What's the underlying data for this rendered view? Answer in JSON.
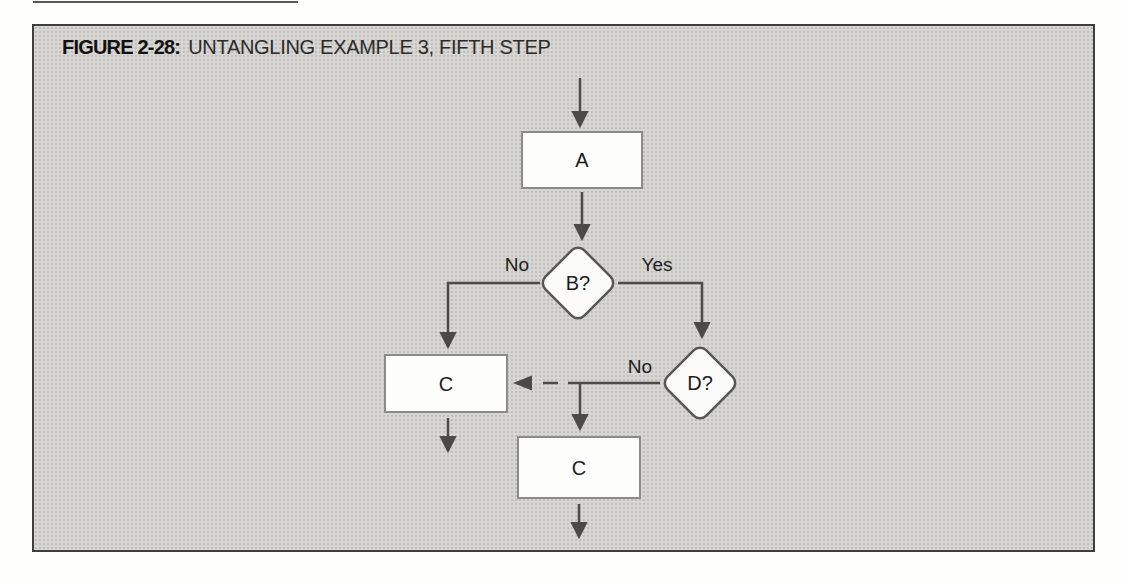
{
  "figure": {
    "label": "FIGURE 2-28:",
    "title": "UNTANGLING EXAMPLE 3, FIFTH STEP"
  },
  "flowchart": {
    "type": "flowchart",
    "nodes": [
      {
        "id": "A",
        "type": "process",
        "label": "A"
      },
      {
        "id": "B",
        "type": "decision",
        "label": "B?"
      },
      {
        "id": "C1",
        "type": "process",
        "label": "C"
      },
      {
        "id": "D",
        "type": "decision",
        "label": "D?"
      },
      {
        "id": "C2",
        "type": "process",
        "label": "C"
      }
    ],
    "edges": [
      {
        "from": "start",
        "to": "A",
        "label": ""
      },
      {
        "from": "A",
        "to": "B",
        "label": ""
      },
      {
        "from": "B",
        "to": "C1",
        "label": "No"
      },
      {
        "from": "B",
        "to": "D",
        "label": "Yes"
      },
      {
        "from": "D",
        "to": "C1",
        "label": "No",
        "style": "dashed"
      },
      {
        "from": "D",
        "to": "C2",
        "label": ""
      },
      {
        "from": "C1",
        "to": "exit",
        "label": ""
      },
      {
        "from": "C2",
        "to": "exit",
        "label": ""
      }
    ],
    "edge_labels": {
      "b_no": "No",
      "b_yes": "Yes",
      "d_no": "No"
    }
  },
  "colors": {
    "frame_border": "#3e3e3c",
    "frame_background": "#d7d6d2",
    "line": "#4a4a48",
    "node_fill": "#fdfdfb",
    "text": "#1c1c1c"
  }
}
